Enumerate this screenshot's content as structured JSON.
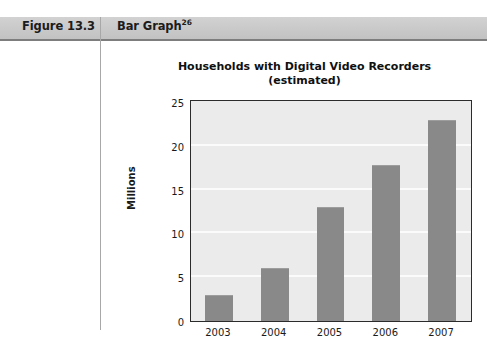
{
  "figure": {
    "number_label": "Figure 13.3",
    "kind_label": "Bar Graph",
    "kind_superscript": "26"
  },
  "chart_data": {
    "type": "bar",
    "title": "Households with Digital Video Recorders (estimated)",
    "title_line1": "Households with Digital Video Recorders",
    "title_line2": "(estimated)",
    "xlabel": "",
    "ylabel": "Millions",
    "categories": [
      "2003",
      "2004",
      "2005",
      "2006",
      "2007"
    ],
    "values": [
      3,
      6,
      13,
      17.8,
      23
    ],
    "ylim": [
      0,
      25
    ],
    "ytick_labels": [
      "0",
      "5",
      "10",
      "15",
      "20",
      "25"
    ],
    "ytick_values": [
      0,
      5,
      10,
      15,
      20,
      25
    ],
    "grid": true,
    "legend": false,
    "bar_color": "#898989",
    "plot_background": "#ebebeb",
    "gridline_color": "#fbfbfb",
    "axis_color": "#2b2b2b"
  }
}
